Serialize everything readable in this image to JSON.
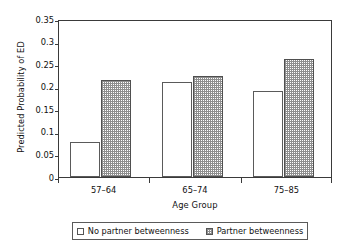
{
  "chart_data": {
    "type": "bar",
    "title": "",
    "subtitle": "",
    "xlabel": "Age Group",
    "ylabel": "Predicted Probability of ED",
    "categories": [
      "57–64",
      "65–74",
      "75–85"
    ],
    "series": [
      {
        "name": "No partner betweenness",
        "values": [
          0.078,
          0.21,
          0.19
        ],
        "style": "open",
        "color": "#ffffff"
      },
      {
        "name": "Partner betweenness",
        "values": [
          0.215,
          0.223,
          0.262
        ],
        "style": "hatched",
        "color": "#8e8e8e"
      }
    ],
    "ylim": [
      0,
      0.35
    ],
    "ytick_values": [
      0,
      0.05,
      0.1,
      0.15,
      0.2,
      0.25,
      0.3,
      0.35
    ],
    "ytick_labels": [
      "0",
      "0.05",
      "0.1",
      "0.15",
      "0.2",
      "0.25",
      "0.3",
      "0.35"
    ],
    "grid": false,
    "legend_position": "bottom",
    "frame": "box"
  },
  "axes": {
    "y_title": "Predicted Probability of ED",
    "x_title": "Age Group",
    "y_ticks": [
      "0.35",
      "0.3",
      "0.25",
      "0.2",
      "0.15",
      "0.1",
      "0.05",
      "0"
    ],
    "x_ticks": [
      "57–64",
      "65–74",
      "75–85"
    ]
  },
  "legend": {
    "entries": [
      {
        "label": "No partner betweenness",
        "swatch": "open-square-icon"
      },
      {
        "label": "Partner betweenness",
        "swatch": "hatched-square-icon"
      }
    ]
  },
  "colors": {
    "axis": "#3a3a3a",
    "bar_outline": "#5a5a5a",
    "hatch": "#8e8e8e",
    "open_fill": "#ffffff",
    "background": "#ffffff",
    "text": "#111111"
  }
}
